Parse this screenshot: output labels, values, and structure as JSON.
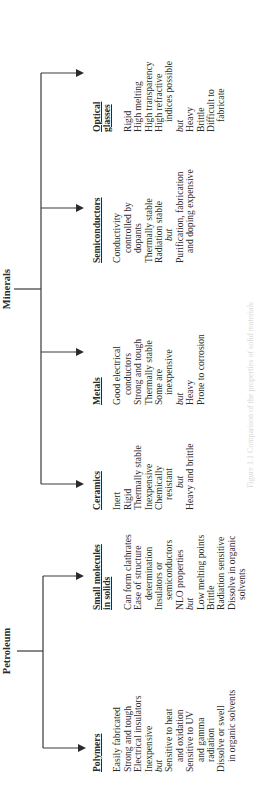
{
  "roots": [
    {
      "label": "Minerals"
    },
    {
      "label": "Petroleum"
    }
  ],
  "categories": [
    {
      "header": [
        "Polymers"
      ],
      "lines": [
        {
          "text": "Easily fabricated"
        },
        {
          "text": "Strong and tough"
        },
        {
          "text": "Electrical insulators"
        },
        {
          "text": "Inexpensive"
        },
        {
          "text": "but",
          "style": "but"
        },
        {
          "text": "Sensitive to heat"
        },
        {
          "text": "and oxidation",
          "style": "indent"
        },
        {
          "text": "Sensitive to UV"
        },
        {
          "text": "and gamma",
          "style": "indent"
        },
        {
          "text": "radiation",
          "style": "indent"
        },
        {
          "text": "Dissolve or swell"
        },
        {
          "text": "in organic solvents",
          "style": "indent"
        }
      ]
    },
    {
      "header": [
        "Small molecules",
        "in solids"
      ],
      "lines": [
        {
          "text": "Can form clathrates"
        },
        {
          "text": "Ease of structure"
        },
        {
          "text": "determination",
          "style": "indent"
        },
        {
          "text": "Insulators or"
        },
        {
          "text": "semiconductors",
          "style": "indent"
        },
        {
          "text": "NLO properties"
        },
        {
          "text": "but",
          "style": "but"
        },
        {
          "text": "Low melting points"
        },
        {
          "text": "Brittle"
        },
        {
          "text": "Radiation sensitive"
        },
        {
          "text": "Dissolve in organic"
        },
        {
          "text": "solvents",
          "style": "indent"
        }
      ]
    },
    {
      "header": [
        "Ceramics"
      ],
      "lines": [
        {
          "text": "Inert"
        },
        {
          "text": "Rigid"
        },
        {
          "text": "Thermally stable"
        },
        {
          "text": "Inexpensive"
        },
        {
          "text": "Chemically"
        },
        {
          "text": "resistant",
          "style": "indent"
        },
        {
          "text": "but",
          "style": "but center"
        },
        {
          "text": "Heavy and brittle"
        }
      ]
    },
    {
      "header": [
        "Metals"
      ],
      "lines": [
        {
          "text": "Good electrical"
        },
        {
          "text": "conductors",
          "style": "indent"
        },
        {
          "text": "Strong and tough"
        },
        {
          "text": "Thermally stable"
        },
        {
          "text": "Some are"
        },
        {
          "text": "inexpensive",
          "style": "indent"
        },
        {
          "text": "but",
          "style": "but"
        },
        {
          "text": "Heavy"
        },
        {
          "text": "Prone to corrosion"
        }
      ]
    },
    {
      "header": [
        "Semiconductors"
      ],
      "lines": [
        {
          "text": "Conductivity"
        },
        {
          "text": "controlled by",
          "style": "indent"
        },
        {
          "text": "dopants",
          "style": "indent"
        },
        {
          "text": "Thermally stable"
        },
        {
          "text": "Radiation stable"
        },
        {
          "text": "but",
          "style": "but center"
        },
        {
          "text": "Purification, fabrication"
        },
        {
          "text": "and doping expensive",
          "style": "indent"
        }
      ]
    },
    {
      "header": [
        "Optical",
        "glasses"
      ],
      "lines": [
        {
          "text": "Rigid"
        },
        {
          "text": "High melting"
        },
        {
          "text": "High transparency"
        },
        {
          "text": "High refractive"
        },
        {
          "text": "indices possible",
          "style": "indent"
        },
        {
          "text": "but",
          "style": "but"
        },
        {
          "text": "Heavy"
        },
        {
          "text": "Brittle"
        },
        {
          "text": "Difficult to"
        },
        {
          "text": "fabricate",
          "style": "indent"
        }
      ]
    }
  ],
  "caption": "Figure 1.1 Comparison of the properties of solid materials"
}
